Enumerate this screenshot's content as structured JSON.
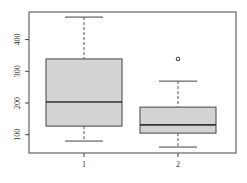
{
  "chart_data": {
    "type": "boxplot",
    "title": "",
    "xlabel": "",
    "ylabel": "",
    "categories": [
      "1",
      "2"
    ],
    "ylim": [
      40,
      500
    ],
    "yticks": [
      100,
      200,
      300,
      400
    ],
    "grid": false,
    "legend": null,
    "box_fill": "#d3d3d3",
    "series": [
      {
        "name": "1",
        "whisker_low": 80,
        "q1": 127,
        "median": 203,
        "q3": 339,
        "whisker_high": 471,
        "outliers": []
      },
      {
        "name": "2",
        "whisker_low": 61,
        "q1": 105,
        "median": 131,
        "q3": 187,
        "whisker_high": 269,
        "outliers": [
          339
        ]
      }
    ]
  }
}
